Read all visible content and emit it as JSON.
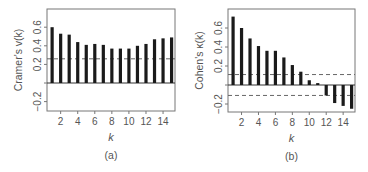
{
  "chart_data": [
    {
      "type": "bar",
      "panel_label": "(a)",
      "title": "",
      "xlabel": "k",
      "ylabel": "Cramer's v(k)",
      "x": [
        1,
        2,
        3,
        4,
        5,
        6,
        7,
        8,
        9,
        10,
        11,
        12,
        13,
        14,
        15
      ],
      "values": [
        0.6,
        0.53,
        0.52,
        0.44,
        0.41,
        0.42,
        0.41,
        0.37,
        0.37,
        0.37,
        0.4,
        0.42,
        0.47,
        0.48,
        0.49
      ],
      "xticks": [
        2,
        4,
        6,
        8,
        10,
        12,
        14
      ],
      "yticks": [
        -0.2,
        0.0,
        0.2,
        0.4,
        0.6
      ],
      "ytick_labels": [
        "−0.2",
        "",
        "0.2",
        "0.4",
        "0.6"
      ],
      "xlim": [
        0.4,
        15.4
      ],
      "ylim": [
        -0.28,
        0.79
      ],
      "reference_lines": [
        {
          "y": 0.0,
          "style": "solid"
        },
        {
          "y": 0.26,
          "style": "dashed"
        }
      ],
      "grid": false,
      "legend": null,
      "layout": {
        "left": 47,
        "right": 175,
        "top": 9,
        "bottom": 111,
        "zero_y": 83,
        "px_per_unit": 93
      }
    },
    {
      "type": "bar",
      "panel_label": "(b)",
      "title": "",
      "xlabel": "k",
      "ylabel": "Cohen's κ(k)",
      "x": [
        1,
        2,
        3,
        4,
        5,
        6,
        7,
        8,
        9,
        10,
        11,
        12,
        13,
        14,
        15
      ],
      "values": [
        0.72,
        0.6,
        0.49,
        0.41,
        0.36,
        0.36,
        0.29,
        0.21,
        0.14,
        0.05,
        0.02,
        -0.11,
        -0.19,
        -0.22,
        -0.25
      ],
      "xticks": [
        2,
        4,
        6,
        8,
        10,
        12,
        14
      ],
      "yticks": [
        -0.2,
        0.0,
        0.2,
        0.4,
        0.6
      ],
      "ytick_labels": [
        "−0.2",
        "",
        "0.2",
        "0.4",
        "0.6"
      ],
      "xlim": [
        0.4,
        15.4
      ],
      "ylim": [
        -0.28,
        0.8
      ],
      "reference_lines": [
        {
          "y": 0.0,
          "style": "solid"
        },
        {
          "y": 0.11,
          "style": "dashed"
        },
        {
          "y": -0.11,
          "style": "dashed"
        }
      ],
      "grid": false,
      "legend": null,
      "layout": {
        "left": 228,
        "right": 355,
        "top": 9,
        "bottom": 112,
        "zero_y": 85,
        "px_per_unit": 95
      }
    }
  ],
  "style": {
    "bar_color": "#1a1a1a",
    "axis_color": "#777777",
    "text_color": "#555555",
    "dash_color": "#666666",
    "zero_line_color": "#333333"
  }
}
